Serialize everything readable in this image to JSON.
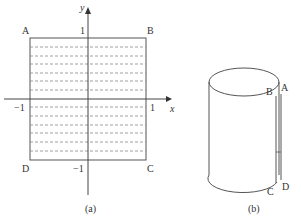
{
  "panel_a": {
    "caption": "(a)",
    "corners": {
      "A": "A",
      "B": "B",
      "C": "C",
      "D": "D"
    },
    "axis_labels": {
      "x": "x",
      "y": "y"
    },
    "ticks": {
      "y_top": "1",
      "y_bottom": "−1",
      "x_left": "−1",
      "x_right": "1"
    },
    "dashed_lines_count": 12
  },
  "panel_b": {
    "caption": "(b)",
    "labels": {
      "A": "A",
      "B": "B",
      "C": "C",
      "D": "D"
    }
  }
}
